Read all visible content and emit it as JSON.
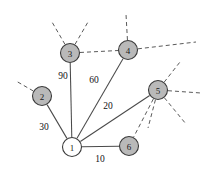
{
  "figure": {
    "background_color": "#ffffff",
    "node_fill_color": "#b9b9b9",
    "node_open_fill_color": "#ffffff",
    "node_stroke_color": "#3a3a3a",
    "edge_solid_color": "#4a4a4a",
    "edge_dashed_color": "#5a5a5a"
  },
  "chart_data": {
    "type": "diagram",
    "title": "",
    "xlabel": "",
    "ylabel": "",
    "graph": {
      "nodes": [
        {
          "id": "1",
          "label": "1",
          "x": 72,
          "y": 147,
          "r": 9.5,
          "style": "open"
        },
        {
          "id": "2",
          "label": "2",
          "x": 42,
          "y": 96,
          "r": 9.5,
          "style": "filled"
        },
        {
          "id": "3",
          "label": "3",
          "x": 70,
          "y": 53,
          "r": 9.5,
          "style": "filled"
        },
        {
          "id": "4",
          "label": "4",
          "x": 128,
          "y": 50,
          "r": 9.5,
          "style": "filled"
        },
        {
          "id": "5",
          "label": "5",
          "x": 158,
          "y": 90,
          "r": 9.5,
          "style": "filled"
        },
        {
          "id": "6",
          "label": "6",
          "x": 129,
          "y": 146,
          "r": 9.5,
          "style": "filled"
        }
      ],
      "edges": [
        {
          "from": "1",
          "to": "2",
          "weight": "30",
          "style": "solid",
          "label_x": 44,
          "label_y": 127
        },
        {
          "from": "1",
          "to": "3",
          "weight": "90",
          "style": "solid",
          "label_x": 63,
          "label_y": 76
        },
        {
          "from": "1",
          "to": "4",
          "weight": "60",
          "style": "solid",
          "label_x": 94,
          "label_y": 80
        },
        {
          "from": "1",
          "to": "5",
          "weight": "20",
          "style": "solid",
          "label_x": 108,
          "label_y": 106
        },
        {
          "from": "1",
          "to": "6",
          "weight": "10",
          "style": "solid",
          "label_x": 100,
          "label_y": 159
        },
        {
          "from": "3",
          "to": "4",
          "weight": "",
          "style": "dashed",
          "label_x": 0,
          "label_y": 0
        },
        {
          "from": "5",
          "to": "6",
          "weight": "",
          "style": "dashed",
          "label_x": 0,
          "label_y": 0
        }
      ],
      "external_stubs": [
        {
          "from": "2",
          "x2": 16,
          "y2": 81,
          "style": "dashed"
        },
        {
          "from": "3",
          "x2": 52,
          "y2": 22,
          "style": "dashed"
        },
        {
          "from": "3",
          "x2": 88,
          "y2": 22,
          "style": "dashed"
        },
        {
          "from": "4",
          "x2": 126,
          "y2": 14,
          "style": "dashed"
        },
        {
          "from": "4",
          "x2": 196,
          "y2": 42,
          "style": "dashed"
        },
        {
          "from": "5",
          "x2": 180,
          "y2": 62,
          "style": "dashed"
        },
        {
          "from": "5",
          "x2": 201,
          "y2": 93,
          "style": "dashed"
        },
        {
          "from": "5",
          "x2": 186,
          "y2": 124,
          "style": "dashed"
        },
        {
          "from": "5",
          "x2": 148,
          "y2": 128,
          "style": "dashed"
        }
      ]
    }
  }
}
